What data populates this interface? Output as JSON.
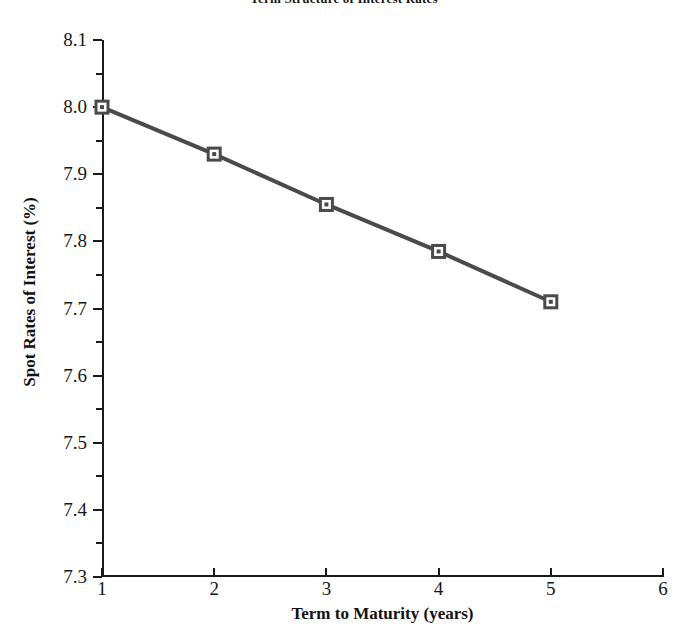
{
  "chart_data": {
    "type": "line",
    "title": "Term Structure of Interest Rates",
    "xlabel": "Term to Maturity (years)",
    "ylabel": "Spot Rates of Interest (%)",
    "x": [
      1,
      2,
      3,
      4,
      5
    ],
    "values": [
      8.0,
      7.93,
      7.855,
      7.785,
      7.71
    ],
    "series": [
      {
        "name": "Spot Rate",
        "values": [
          8.0,
          7.93,
          7.855,
          7.785,
          7.71
        ]
      }
    ],
    "xlim": [
      1,
      6
    ],
    "ylim": [
      7.3,
      8.1
    ],
    "xticks": [
      "1",
      "2",
      "3",
      "4",
      "5",
      "6"
    ],
    "xtick_values": [
      1,
      2,
      3,
      4,
      5,
      6
    ],
    "yticks": [
      "8.1",
      "8.0",
      "7.9",
      "7.8",
      "7.7",
      "7.6",
      "7.5",
      "7.4",
      "7.3"
    ],
    "ytick_values": [
      8.1,
      8.0,
      7.9,
      7.8,
      7.7,
      7.6,
      7.5,
      7.4,
      7.3
    ],
    "ytick_minor_values": [
      8.05,
      7.95,
      7.85,
      7.75,
      7.65,
      7.55,
      7.45,
      7.35
    ],
    "grid": false,
    "legend": null,
    "marker": "square",
    "line_color": "#4a4a4a",
    "marker_face_color": "#ffffff",
    "marker_edge_color": "#4a4a4a",
    "axis_color": "#1a1a1a",
    "background_color": "#ffffff"
  }
}
